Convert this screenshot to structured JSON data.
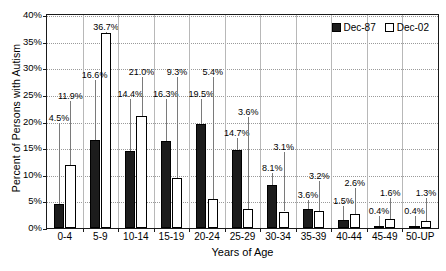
{
  "chart_data": {
    "type": "bar",
    "title": "",
    "xlabel": "Years of Age",
    "ylabel": "Percent of Persons with Autism",
    "ylim": [
      0,
      40
    ],
    "ytick_labels": [
      "0%",
      "5%",
      "10%",
      "15%",
      "20%",
      "25%",
      "30%",
      "35%",
      "40%"
    ],
    "ytick_values": [
      0,
      5,
      10,
      15,
      20,
      25,
      30,
      35,
      40
    ],
    "grid": true,
    "legend_position": "top-right",
    "categories": [
      "0-4",
      "5-9",
      "10-14",
      "15-19",
      "20-24",
      "25-29",
      "30-34",
      "35-39",
      "40-44",
      "45-49",
      "50-UP"
    ],
    "series": [
      {
        "name": "Dec-87",
        "color": "#1c1c1c",
        "values": [
          4.5,
          16.6,
          14.4,
          16.3,
          19.5,
          14.7,
          8.1,
          3.6,
          1.5,
          0.4,
          0.4
        ],
        "labels": [
          "4.5%",
          "16.6%",
          "14.4%",
          "16.3%",
          "19.5%",
          "14.7%",
          "8.1%",
          "3.6%",
          "1.5%",
          "0.4%",
          "0.4%"
        ]
      },
      {
        "name": "Dec-02",
        "color": "#ffffff",
        "values": [
          11.9,
          36.7,
          21.0,
          9.3,
          5.4,
          3.6,
          3.1,
          3.2,
          2.6,
          1.6,
          1.3
        ],
        "labels": [
          "11.9%",
          "36.7%",
          "21.0%",
          "9.3%",
          "5.4%",
          "3.6%",
          "3.1%",
          "3.2%",
          "2.6%",
          "1.6%",
          "1.3%"
        ]
      }
    ],
    "label_rows": {
      "note": "Dec-87 labels sit on lower row, Dec-02 labels on upper row, except 5-9 Dec-02 which sits above its tall bar",
      "dark_label_y_pct": [
        21.5,
        29.5,
        26.0,
        26.0,
        26.0,
        18.5,
        12.0,
        7.0,
        5.8,
        4.0,
        4.0
      ],
      "light_label_y_pct": [
        25.5,
        38.5,
        30.0,
        30.0,
        30.0,
        22.5,
        16.0,
        10.5,
        9.2,
        7.4,
        7.4
      ]
    }
  },
  "legend": {
    "entries": [
      {
        "label": "Dec-87",
        "style": "dark"
      },
      {
        "label": "Dec-02",
        "style": "light"
      }
    ]
  }
}
